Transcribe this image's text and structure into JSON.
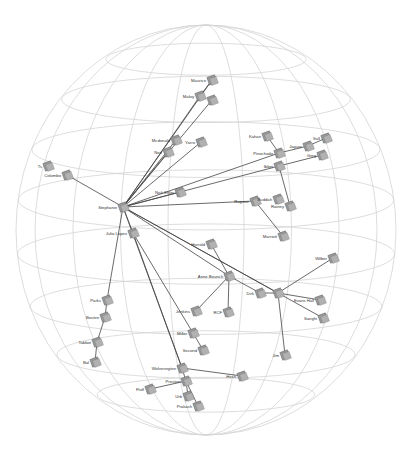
{
  "diagram": {
    "type": "3d-sphere-network-graph",
    "sphere": {
      "cx": 206,
      "cy": 230,
      "rx": 190,
      "ry": 205,
      "grid_color": "#cfcfcf"
    },
    "edge_color": "#444444",
    "node_color": "#9a9a9a",
    "nodes": [
      {
        "id": "maurice",
        "label": "Maurice",
        "x": 212,
        "y": 80
      },
      {
        "id": "maloy",
        "label": "Maloy",
        "x": 200,
        "y": 96
      },
      {
        "id": "maloy2",
        "label": "",
        "x": 212,
        "y": 100
      },
      {
        "id": "mcdonald",
        "label": "Mcdonald",
        "x": 176,
        "y": 140
      },
      {
        "id": "yarro",
        "label": "Yarro",
        "x": 201,
        "y": 142
      },
      {
        "id": "nett",
        "label": "Nett",
        "x": 168,
        "y": 152
      },
      {
        "id": "kahan",
        "label": "Kahan",
        "x": 267,
        "y": 136
      },
      {
        "id": "jaguar",
        "label": "Jaguar",
        "x": 308,
        "y": 146
      },
      {
        "id": "sull",
        "label": "Sull",
        "x": 326,
        "y": 138
      },
      {
        "id": "pinochado",
        "label": "Pinochado",
        "x": 279,
        "y": 153
      },
      {
        "id": "greg",
        "label": "Greg",
        "x": 322,
        "y": 155
      },
      {
        "id": "ibbet",
        "label": "Ibbet",
        "x": 279,
        "y": 166
      },
      {
        "id": "colombo",
        "label": "Colombo",
        "x": 67,
        "y": 175
      },
      {
        "id": "tr_small",
        "label": "Ts",
        "x": 48,
        "y": 166
      },
      {
        "id": "riddle",
        "label": "Nisk Ehler",
        "x": 180,
        "y": 192
      },
      {
        "id": "stephanie",
        "label": "Stephanie",
        "x": 123,
        "y": 207
      },
      {
        "id": "rajpour",
        "label": "Rajpour",
        "x": 255,
        "y": 201
      },
      {
        "id": "buddah",
        "label": "Buddah",
        "x": 278,
        "y": 199
      },
      {
        "id": "rainey",
        "label": "Rainey",
        "x": 290,
        "y": 206
      },
      {
        "id": "marriott",
        "label": "Marriott",
        "x": 283,
        "y": 236
      },
      {
        "id": "julia",
        "label": "Julia Lopez",
        "x": 133,
        "y": 233
      },
      {
        "id": "harrold",
        "label": "Harrold",
        "x": 211,
        "y": 244
      },
      {
        "id": "anne",
        "label": "Anne Bounch",
        "x": 229,
        "y": 276
      },
      {
        "id": "wilber",
        "label": "Wilber",
        "x": 333,
        "y": 258
      },
      {
        "id": "dirk",
        "label": "Dirk",
        "x": 260,
        "y": 293
      },
      {
        "id": "hub2",
        "label": "",
        "x": 278,
        "y": 293
      },
      {
        "id": "evans",
        "label": "Evans Hall",
        "x": 320,
        "y": 300
      },
      {
        "id": "sanghi",
        "label": "Sanghi",
        "x": 323,
        "y": 318
      },
      {
        "id": "parks",
        "label": "Parks",
        "x": 107,
        "y": 300
      },
      {
        "id": "boston",
        "label": "Boston",
        "x": 105,
        "y": 317
      },
      {
        "id": "jenkins",
        "label": "Jenkins",
        "x": 196,
        "y": 311
      },
      {
        "id": "rcf",
        "label": "RCF",
        "x": 228,
        "y": 312
      },
      {
        "id": "miller",
        "label": "Miller",
        "x": 193,
        "y": 333
      },
      {
        "id": "tabbot",
        "label": "Tabbot",
        "x": 97,
        "y": 342
      },
      {
        "id": "second",
        "label": "Second",
        "x": 203,
        "y": 350
      },
      {
        "id": "jim",
        "label": "Jim",
        "x": 285,
        "y": 355
      },
      {
        "id": "bal",
        "label": "Bal",
        "x": 95,
        "y": 362
      },
      {
        "id": "wolverington",
        "label": "Wolverington",
        "x": 182,
        "y": 368
      },
      {
        "id": "preston",
        "label": "Preston",
        "x": 186,
        "y": 381
      },
      {
        "id": "hirsh",
        "label": "Hirsh",
        "x": 242,
        "y": 376
      },
      {
        "id": "fluff",
        "label": "Fluff",
        "x": 150,
        "y": 389
      },
      {
        "id": "urb",
        "label": "Urb",
        "x": 188,
        "y": 396
      },
      {
        "id": "prakash",
        "label": "Prakash",
        "x": 198,
        "y": 406
      }
    ],
    "edges": [
      [
        "stephanie",
        "maurice"
      ],
      [
        "stephanie",
        "maloy"
      ],
      [
        "stephanie",
        "maloy2"
      ],
      [
        "stephanie",
        "mcdonald"
      ],
      [
        "stephanie",
        "yarro"
      ],
      [
        "stephanie",
        "nett"
      ],
      [
        "maurice",
        "maloy"
      ],
      [
        "stephanie",
        "colombo"
      ],
      [
        "stephanie",
        "riddle"
      ],
      [
        "stephanie",
        "pinochado"
      ],
      [
        "stephanie",
        "ibbet"
      ],
      [
        "pinochado",
        "jaguar"
      ],
      [
        "jaguar",
        "sull"
      ],
      [
        "ibbet",
        "greg"
      ],
      [
        "kahan",
        "pinochado"
      ],
      [
        "ibbet",
        "rainey"
      ],
      [
        "stephanie",
        "rajpour"
      ],
      [
        "rajpour",
        "marriott"
      ],
      [
        "stephanie",
        "julia"
      ],
      [
        "stephanie",
        "anne"
      ],
      [
        "stephanie",
        "hub2"
      ],
      [
        "stephanie",
        "sanghi"
      ],
      [
        "harrold",
        "anne"
      ],
      [
        "anne",
        "dirk"
      ],
      [
        "anne",
        "jenkins"
      ],
      [
        "anne",
        "rcf"
      ],
      [
        "hub2",
        "wilber"
      ],
      [
        "hub2",
        "evans"
      ],
      [
        "hub2",
        "jim"
      ],
      [
        "dirk",
        "hub2"
      ],
      [
        "stephanie",
        "parks"
      ],
      [
        "parks",
        "boston"
      ],
      [
        "boston",
        "tabbot"
      ],
      [
        "tabbot",
        "bal"
      ],
      [
        "julia",
        "wolverington"
      ],
      [
        "stephanie",
        "wolverington"
      ],
      [
        "julia",
        "miller"
      ],
      [
        "miller",
        "second"
      ],
      [
        "wolverington",
        "hirsh"
      ],
      [
        "wolverington",
        "preston"
      ],
      [
        "preston",
        "fluff"
      ],
      [
        "preston",
        "urb"
      ],
      [
        "preston",
        "prakash"
      ]
    ]
  }
}
